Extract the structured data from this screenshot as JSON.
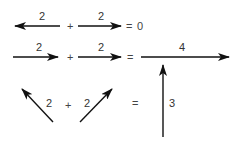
{
  "colors": {
    "arrow": "#111111",
    "text": "#333333",
    "background": "#ffffff"
  },
  "rows": [
    {
      "name": "opposite-vectors",
      "vectors": [
        {
          "label": "2",
          "direction": "left",
          "x1": 60,
          "y1": 26,
          "x2": 15,
          "y2": 26,
          "lx": 39,
          "ly": 20
        },
        {
          "label": "2",
          "direction": "right",
          "x1": 78,
          "y1": 26,
          "x2": 121,
          "y2": 26,
          "lx": 98,
          "ly": 20
        }
      ],
      "plus": {
        "text": "+",
        "x": 67,
        "y": 30
      },
      "equals": {
        "text": "=",
        "x": 126,
        "y": 30
      },
      "result_text": {
        "text": "0",
        "x": 137,
        "y": 30
      }
    },
    {
      "name": "same-direction-vectors",
      "vectors": [
        {
          "label": "2",
          "direction": "right",
          "x1": 13,
          "y1": 57,
          "x2": 58,
          "y2": 57,
          "lx": 36,
          "ly": 51
        },
        {
          "label": "2",
          "direction": "right",
          "x1": 78,
          "y1": 57,
          "x2": 121,
          "y2": 57,
          "lx": 98,
          "ly": 51
        }
      ],
      "plus": {
        "text": "+",
        "x": 67,
        "y": 61
      },
      "equals": {
        "text": "=",
        "x": 127,
        "y": 61
      },
      "result_vector": {
        "label": "4",
        "direction": "right",
        "x1": 141,
        "y1": 57,
        "x2": 229,
        "y2": 57,
        "lx": 179,
        "ly": 51
      }
    },
    {
      "name": "angled-vectors",
      "vectors": [
        {
          "label": "2",
          "direction": "up-left",
          "x1": 53,
          "y1": 122,
          "x2": 22,
          "y2": 89,
          "lx": 46,
          "ly": 107
        },
        {
          "label": "2",
          "direction": "up-right",
          "x1": 80,
          "y1": 122,
          "x2": 112,
          "y2": 89,
          "lx": 84,
          "ly": 107
        }
      ],
      "plus": {
        "text": "+",
        "x": 65,
        "y": 109
      },
      "equals": {
        "text": "=",
        "x": 132,
        "y": 107
      },
      "result_vector": {
        "label": "3",
        "direction": "up",
        "x1": 163,
        "y1": 137,
        "x2": 163,
        "y2": 65,
        "lx": 169,
        "ly": 107
      }
    }
  ]
}
